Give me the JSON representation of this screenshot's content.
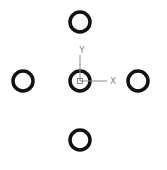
{
  "diagram": {
    "circles": [
      {
        "id": "top",
        "cx": 80,
        "cy": 22
      },
      {
        "id": "left",
        "cx": 23,
        "cy": 81
      },
      {
        "id": "center",
        "cx": 80,
        "cy": 81
      },
      {
        "id": "right",
        "cx": 138,
        "cy": 81
      },
      {
        "id": "bottom",
        "cx": 80,
        "cy": 140
      }
    ],
    "axis_labels": {
      "x": "X",
      "y": "Y"
    },
    "colors": {
      "circle": "#111111",
      "axis": "#888888"
    }
  }
}
